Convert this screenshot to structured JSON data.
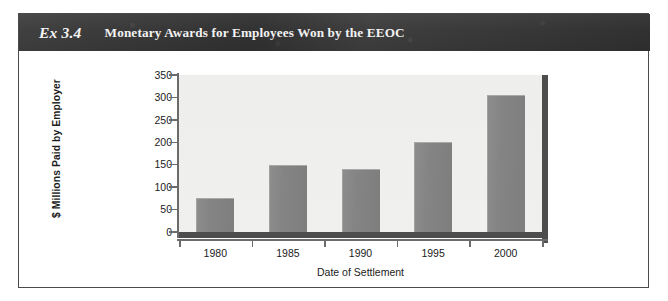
{
  "exhibit": {
    "label": "Ex 3.4",
    "title": "Monetary Awards for Employees Won by the EEOC"
  },
  "colors": {
    "header_band": "#3a3a3a",
    "header_text": "#f2f2f2",
    "card_border": "#4a4a4a",
    "plot_background": "#efefed",
    "bar_fill": "#848484",
    "axis": "#6b6b6b",
    "plot_edge": "#4d4d4d"
  },
  "chart_data": {
    "type": "bar",
    "title": "Monetary Awards for Employees Won by the EEOC",
    "xlabel": "Date of Settlement",
    "ylabel": "$ Millions Paid by Employer",
    "categories": [
      "1980",
      "1985",
      "1990",
      "1995",
      "2000"
    ],
    "values": [
      75,
      150,
      140,
      200,
      305
    ],
    "ylim": [
      0,
      350
    ],
    "yticks": [
      0,
      50,
      100,
      150,
      200,
      250,
      300,
      350
    ],
    "ytick_labels": [
      "0",
      "50",
      "100",
      "150",
      "200",
      "250",
      "300",
      "350"
    ],
    "grid": false,
    "legend": null
  }
}
